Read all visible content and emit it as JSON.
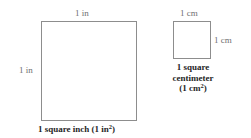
{
  "figure": {
    "background_color": "#ffffff",
    "line_color": "#8d8d8d",
    "label_color": "#6f6f6f",
    "caption_color": "#262626"
  },
  "shapes": {
    "inch_square": {
      "name": "1 square inch",
      "top_label": "1 in",
      "left_label": "1 in",
      "caption_text": "1 square inch (1 in",
      "caption_exponent": "2",
      "caption_close": ")"
    },
    "cm_square": {
      "name": "1 square centimeter",
      "top_label": "1 cm",
      "right_label": "1 cm",
      "caption_line1": "1 square",
      "caption_line2": "centimeter",
      "caption_line3_open": "(1 cm",
      "caption_exponent": "2",
      "caption_line3_close": ")"
    }
  }
}
